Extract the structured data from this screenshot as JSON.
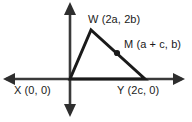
{
  "figure": {
    "kind": "coordinate-plane-triangle-diagram",
    "background_color": "#ffffff",
    "stroke_color": "#1a1a1a",
    "axis_color": "#3a3a3a",
    "labels": {
      "w": "W (2a, 2b)",
      "m": "M (a + c, b)",
      "x": "X (0, 0)",
      "y": "Y (2c, 0)"
    },
    "points": {
      "x": {
        "name": "X",
        "coords": "(0, 0)",
        "px": 70,
        "py": 79
      },
      "w": {
        "name": "W",
        "coords": "(2a, 2b)",
        "px": 91,
        "py": 30
      },
      "y": {
        "name": "Y",
        "coords": "(2c, 0)",
        "px": 145,
        "py": 79
      },
      "m": {
        "name": "M",
        "coords": "(a + c, b)",
        "px": 117,
        "py": 53
      }
    },
    "axes": {
      "x_axis": {
        "y": 79,
        "x_start": 3,
        "x_end": 185,
        "arrows": "both"
      },
      "y_axis": {
        "x": 70,
        "y_start": 2,
        "y_end": 117,
        "arrows": "both"
      }
    },
    "shape": {
      "type": "triangle",
      "vertices": [
        "X",
        "W",
        "Y"
      ],
      "marked_midpoint": "M"
    }
  }
}
